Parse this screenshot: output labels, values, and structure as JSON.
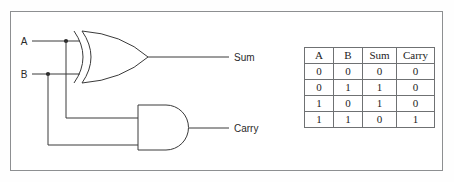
{
  "figure": {
    "type": "half-adder-logic-circuit",
    "inputs": [
      {
        "label": "A"
      },
      {
        "label": "B"
      }
    ],
    "outputs": [
      {
        "label": "Sum"
      },
      {
        "label": "Carry"
      }
    ],
    "gates": [
      {
        "name": "xor-gate",
        "type": "XOR",
        "output": "Sum"
      },
      {
        "name": "and-gate",
        "type": "AND",
        "output": "Carry"
      }
    ],
    "colors": {
      "line": "#3a3a3a",
      "border": "#8d8f91",
      "table_border": "#6f7173",
      "background": "#ffffff",
      "text": "#2a2a2a"
    }
  },
  "truth_table": {
    "headers": [
      "A",
      "B",
      "Sum",
      "Carry"
    ],
    "rows": [
      [
        "0",
        "0",
        "0",
        "0"
      ],
      [
        "0",
        "1",
        "1",
        "0"
      ],
      [
        "1",
        "0",
        "1",
        "0"
      ],
      [
        "1",
        "1",
        "0",
        "1"
      ]
    ]
  }
}
